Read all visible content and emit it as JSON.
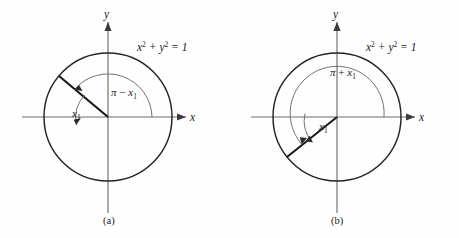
{
  "figure": {
    "background_color": "#fefefe",
    "stroke_color": "#17171a",
    "axis_color": "#6d6d70",
    "arc_color": "#6b6b6f"
  },
  "panels": [
    {
      "id": "a",
      "caption": "(a)",
      "equation": {
        "base1": "x",
        "exp1": "2",
        "plus": " + ",
        "base2": "y",
        "exp2": "2",
        "equals": " = 1"
      },
      "equation_text": "x2 + y2 = 1",
      "axis_x_label": "x",
      "axis_y_label": "y",
      "angle_main": {
        "lead": "π",
        "op": " − ",
        "var": "x",
        "sub": "1"
      },
      "angle_main_text": "π − x1",
      "angle_ref": {
        "var": "x",
        "sub": "1"
      },
      "angle_ref_text": "x1",
      "geometry": {
        "center_x": 108,
        "center_y": 117,
        "radius": 64,
        "terminal_angle_deg": 140,
        "reference_angle_deg": 40
      }
    },
    {
      "id": "b",
      "caption": "(b)",
      "equation": {
        "base1": "x",
        "exp1": "2",
        "plus": " + ",
        "base2": "y",
        "exp2": "2",
        "equals": " = 1"
      },
      "equation_text": "x2 + y2 = 1",
      "axis_x_label": "x",
      "axis_y_label": "y",
      "angle_main": {
        "lead": "π",
        "op": " + ",
        "var": "x",
        "sub": "1"
      },
      "angle_main_text": "π + x1",
      "angle_ref": {
        "var": "x",
        "sub": "1"
      },
      "angle_ref_text": "x1",
      "geometry": {
        "center_x": 108,
        "center_y": 117,
        "radius": 64,
        "terminal_angle_deg": 219,
        "reference_angle_deg": 39
      }
    }
  ]
}
